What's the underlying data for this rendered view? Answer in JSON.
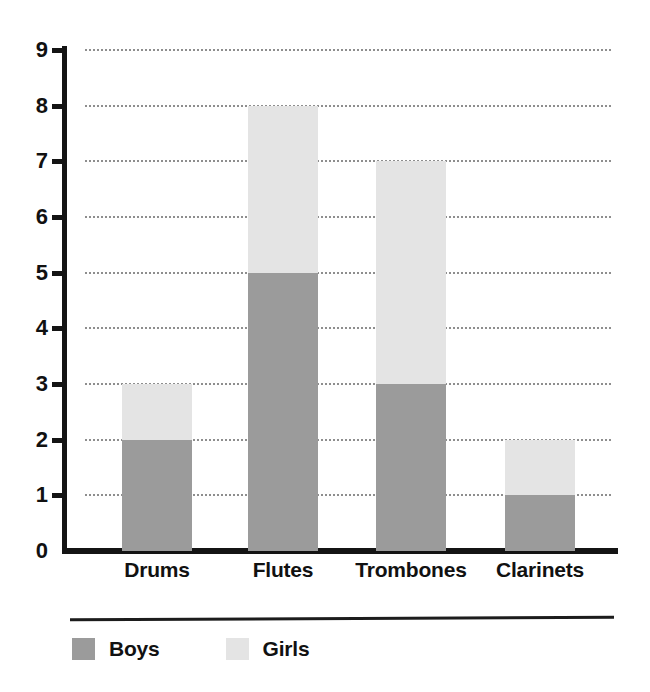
{
  "chart_data": {
    "type": "bar",
    "subtype": "stacked-bar",
    "title": "",
    "subtitle": "",
    "xlabel": "",
    "ylabel": "",
    "categories": [
      "Drums",
      "Flutes",
      "Trombones",
      "Clarinets"
    ],
    "series": [
      {
        "name": "Boys",
        "color": "#9b9b9b",
        "values": [
          2,
          5,
          3,
          1
        ]
      },
      {
        "name": "Girls",
        "color": "#e4e4e4",
        "values": [
          1,
          3,
          4,
          1
        ]
      }
    ],
    "totals": [
      3,
      8,
      7,
      2
    ],
    "ylim": [
      0,
      9
    ],
    "ytick_labels": [
      "0",
      "1",
      "2",
      "3",
      "4",
      "5",
      "6",
      "7",
      "8",
      "9"
    ],
    "ytick_values": [
      0,
      1,
      2,
      3,
      4,
      5,
      6,
      7,
      8,
      9
    ],
    "ytick_step": 1,
    "grid": true,
    "grid_style": "dotted",
    "grid_axis": "y",
    "legend_position": "bottom-left",
    "legend_entries": [
      "Boys",
      "Girls"
    ],
    "axis_color": "#141414",
    "background": "#ffffff"
  }
}
